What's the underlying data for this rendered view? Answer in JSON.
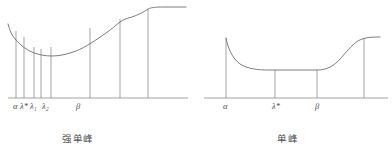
{
  "figures": [
    {
      "id": "strong-unimodal",
      "caption": "强单峰",
      "caption_x": 62,
      "caption_y": 131,
      "axis": {
        "x1": 8,
        "x2": 188,
        "y": 98
      },
      "labels": [
        {
          "text": "α",
          "x": 13,
          "y": 101
        },
        {
          "text": "λ*",
          "x": 20,
          "y": 101
        },
        {
          "text": "λ₁",
          "x": 30,
          "y": 101
        },
        {
          "text": "λ₂",
          "x": 42,
          "y": 101
        },
        {
          "text": "β",
          "x": 76,
          "y": 101
        }
      ],
      "verticals": [
        {
          "x": 16,
          "y_top": 31
        },
        {
          "x": 24,
          "y_top": 37
        },
        {
          "x": 34,
          "y_top": 47
        },
        {
          "x": 41,
          "y_top": 49
        },
        {
          "x": 51,
          "y_top": 47
        },
        {
          "x": 90,
          "y_top": 28
        },
        {
          "x": 120,
          "y_top": 19
        },
        {
          "x": 148,
          "y_top": 9
        }
      ],
      "curve": "M 8,24 C 10,31 12,36 16,40 C 21,46 27,50 34,53 C 40,55 46,56 52,56 C 60,56 68,54 76,51 C 86,47 96,40 106,33 C 112,29 116,25 120,22 C 124,19 128,18 132,17 C 138,15 144,12 148,9 C 152,7 158,7 166,7 L 186,7",
      "curve_label": "strong unimodal function curve"
    },
    {
      "id": "unimodal",
      "caption": "单峰",
      "caption_x": 277,
      "caption_y": 131,
      "axis": {
        "x1": 204,
        "x2": 388,
        "y": 98
      },
      "labels": [
        {
          "text": "α",
          "x": 223,
          "y": 101
        },
        {
          "text": "λ*",
          "x": 272,
          "y": 101
        },
        {
          "text": "β",
          "x": 315,
          "y": 101
        }
      ],
      "verticals": [
        {
          "x": 226,
          "y_top": 38
        },
        {
          "x": 275,
          "y_top": 70
        },
        {
          "x": 317,
          "y_top": 70
        },
        {
          "x": 364,
          "y_top": 38
        }
      ],
      "curve": "M 226,38 C 228,48 232,58 240,64 C 248,69 258,70 268,70 L 275,70 L 317,70 C 327,70 334,66 341,58 C 348,50 354,42 362,39 C 368,37 374,37 380,37",
      "curve_label": "unimodal function curve"
    }
  ],
  "style": {
    "line_color": "#7d7d7d",
    "curve_color": "#6e6e6e",
    "axis_color": "#8a8a8a",
    "text_color": "#4e4e4e",
    "background": "#ffffff"
  }
}
